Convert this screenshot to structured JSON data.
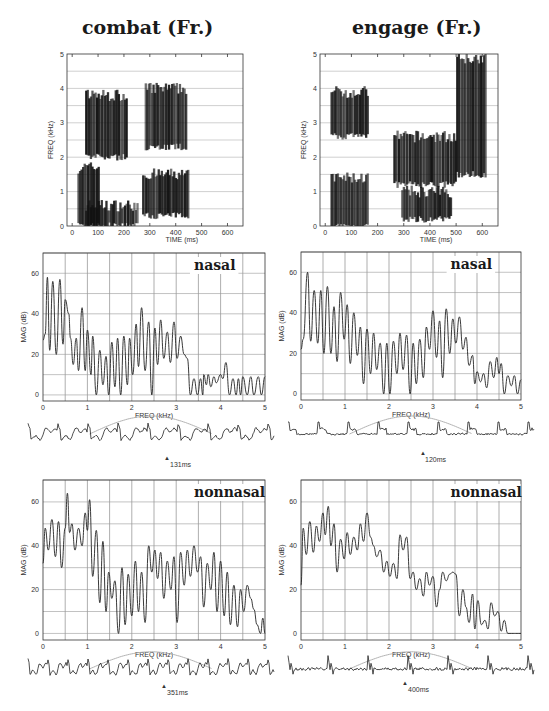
{
  "figure": {
    "columns": [
      {
        "title": "combat (Fr.)",
        "spectrogram": {
          "xlabel": "TIME (ms)",
          "ylabel": "FREQ (kHz)",
          "xticks": [
            "0",
            "100",
            "200",
            "300",
            "400",
            "500",
            "600"
          ],
          "yticks": [
            "0",
            "1",
            "2",
            "3",
            "4",
            "5"
          ]
        },
        "nasal": {
          "tag": "nasal",
          "xlabel": "FREQ (kHz)",
          "ylabel": "MAG (dB)",
          "xticks": [
            "0",
            "1",
            "2",
            "3",
            "4",
            "5"
          ],
          "yticks": [
            "0",
            "20",
            "40",
            "60"
          ],
          "time_marker": "131ms"
        },
        "nonnasal": {
          "tag": "nonnasal",
          "xlabel": "FREQ (kHz)",
          "ylabel": "MAG (dB)",
          "xticks": [
            "0",
            "1",
            "2",
            "3",
            "4",
            "5"
          ],
          "yticks": [
            "0",
            "20",
            "40",
            "60"
          ],
          "time_marker": "351ms"
        }
      },
      {
        "title": "engage (Fr.)",
        "spectrogram": {
          "xlabel": "TIME (ms)",
          "ylabel": "FREQ (kHz)",
          "xticks": [
            "0",
            "100",
            "200",
            "300",
            "400",
            "500",
            "600"
          ],
          "yticks": [
            "0",
            "1",
            "2",
            "3",
            "4",
            "5"
          ]
        },
        "nasal": {
          "tag": "nasal",
          "xlabel": "FREQ (kHz)",
          "ylabel": "MAG (dB)",
          "xticks": [
            "0",
            "1",
            "2",
            "3",
            "4",
            "5"
          ],
          "yticks": [
            "0",
            "20",
            "40",
            "60"
          ],
          "time_marker": "120ms"
        },
        "nonnasal": {
          "tag": "nonnasal",
          "xlabel": "FREQ (kHz)",
          "ylabel": "MAG (dB)",
          "xticks": [
            "0",
            "1",
            "2",
            "3",
            "4",
            "5"
          ],
          "yticks": [
            "0",
            "20",
            "40",
            "60"
          ],
          "time_marker": "400ms"
        }
      }
    ]
  },
  "chart_data": [
    {
      "type": "heatmap",
      "title": "combat (Fr.)",
      "xlabel": "TIME (ms)",
      "ylabel": "FREQ (kHz)",
      "xlim": [
        -20,
        660
      ],
      "ylim": [
        0,
        5
      ],
      "grid": true,
      "regions_dark": [
        {
          "time_ms": [
            20,
            100
          ],
          "freq_khz": [
            0,
            1.7
          ]
        },
        {
          "time_ms": [
            50,
            250
          ],
          "freq_khz": [
            0,
            0.6
          ]
        },
        {
          "time_ms": [
            50,
            210
          ],
          "freq_khz": [
            2.0,
            3.8
          ]
        },
        {
          "time_ms": [
            270,
            450
          ],
          "freq_khz": [
            0.3,
            1.5
          ]
        },
        {
          "time_ms": [
            280,
            440
          ],
          "freq_khz": [
            2.3,
            4.0
          ]
        }
      ]
    },
    {
      "type": "heatmap",
      "title": "engage (Fr.)",
      "xlabel": "TIME (ms)",
      "ylabel": "FREQ (kHz)",
      "xlim": [
        -20,
        660
      ],
      "ylim": [
        0,
        5
      ],
      "grid": true,
      "regions_dark": [
        {
          "time_ms": [
            20,
            160
          ],
          "freq_khz": [
            2.6,
            3.9
          ]
        },
        {
          "time_ms": [
            20,
            160
          ],
          "freq_khz": [
            0,
            1.4
          ]
        },
        {
          "time_ms": [
            260,
            500
          ],
          "freq_khz": [
            1.2,
            2.6
          ]
        },
        {
          "time_ms": [
            290,
            480
          ],
          "freq_khz": [
            0.2,
            1.0
          ]
        },
        {
          "time_ms": [
            500,
            610
          ],
          "freq_khz": [
            1.5,
            4.9
          ]
        }
      ]
    },
    {
      "type": "line",
      "title": "combat nasal (131ms)",
      "xlabel": "FREQ (kHz)",
      "ylabel": "MAG (dB)",
      "xlim": [
        0,
        5
      ],
      "ylim": [
        -3,
        70
      ],
      "grid": true,
      "x": [
        0,
        0.05,
        0.1,
        0.15,
        0.22,
        0.3,
        0.38,
        0.45,
        0.5,
        0.58,
        0.62,
        0.68,
        0.75,
        0.8,
        0.88,
        0.95,
        1.0,
        1.08,
        1.12,
        1.2,
        1.28,
        1.35,
        1.42,
        1.48,
        1.55,
        1.62,
        1.68,
        1.75,
        1.82,
        1.9,
        1.95,
        2.02,
        2.1,
        2.15,
        2.22,
        2.3,
        2.38,
        2.45,
        2.52,
        2.58,
        2.65,
        2.72,
        2.8,
        2.87,
        2.95,
        3.02,
        3.1,
        3.18,
        3.25,
        3.32,
        3.4,
        3.48,
        3.55,
        3.6,
        3.62,
        3.68,
        3.72,
        3.78,
        3.85,
        3.9,
        4.0,
        4.05,
        4.12,
        4.2,
        4.28,
        4.35,
        4.4,
        4.45,
        4.5,
        4.6,
        4.68,
        4.75,
        4.85,
        4.92,
        5.0
      ],
      "y": [
        27,
        30,
        58,
        22,
        56,
        20,
        57,
        25,
        47,
        40,
        28,
        15,
        28,
        12,
        43,
        12,
        32,
        10,
        29,
        0,
        22,
        5,
        19,
        0,
        26,
        4,
        28,
        0,
        29,
        5,
        28,
        10,
        35,
        14,
        43,
        12,
        36,
        0,
        33,
        15,
        37,
        18,
        31,
        16,
        36,
        18,
        29,
        20,
        18,
        0,
        8,
        0,
        8,
        0,
        10,
        5,
        10,
        4,
        9,
        6,
        10,
        8,
        16,
        0,
        8,
        0,
        8,
        0,
        9,
        0,
        9,
        0,
        9,
        0,
        9
      ],
      "annotations": [
        "nasal"
      ]
    },
    {
      "type": "line",
      "title": "engage nasal (120ms)",
      "xlabel": "FREQ (kHz)",
      "ylabel": "MAG (dB)",
      "xlim": [
        0,
        5
      ],
      "ylim": [
        -3,
        70
      ],
      "grid": true,
      "x": [
        0,
        0.05,
        0.15,
        0.22,
        0.3,
        0.38,
        0.45,
        0.52,
        0.6,
        0.68,
        0.75,
        0.82,
        0.9,
        0.98,
        1.05,
        1.12,
        1.2,
        1.28,
        1.35,
        1.42,
        1.5,
        1.58,
        1.65,
        1.72,
        1.8,
        1.88,
        1.95,
        2.02,
        2.1,
        2.18,
        2.25,
        2.32,
        2.4,
        2.48,
        2.55,
        2.62,
        2.7,
        2.78,
        2.85,
        2.92,
        3.0,
        3.08,
        3.15,
        3.22,
        3.3,
        3.38,
        3.45,
        3.52,
        3.6,
        3.68,
        3.75,
        3.82,
        3.9,
        3.95,
        4.0,
        4.08,
        4.15,
        4.22,
        4.3,
        4.38,
        4.45,
        4.5,
        4.55,
        4.62,
        4.7,
        4.78,
        4.85,
        4.92,
        5.0
      ],
      "y": [
        22,
        27,
        60,
        26,
        51,
        25,
        51,
        20,
        53,
        20,
        43,
        16,
        50,
        27,
        44,
        15,
        40,
        19,
        33,
        5,
        32,
        10,
        30,
        12,
        25,
        0,
        25,
        0,
        26,
        10,
        30,
        12,
        29,
        0,
        25,
        5,
        27,
        8,
        33,
        22,
        41,
        18,
        36,
        8,
        42,
        20,
        37,
        25,
        38,
        22,
        28,
        14,
        19,
        5,
        11,
        6,
        10,
        3,
        16,
        8,
        18,
        10,
        15,
        0,
        9,
        4,
        9,
        0,
        7
      ],
      "annotations": [
        "nasal"
      ]
    },
    {
      "type": "line",
      "title": "combat nonnasal (351ms)",
      "xlabel": "FREQ (kHz)",
      "ylabel": "MAG (dB)",
      "xlim": [
        0,
        5
      ],
      "ylim": [
        -3,
        70
      ],
      "grid": true,
      "x": [
        0,
        0.05,
        0.12,
        0.2,
        0.28,
        0.35,
        0.42,
        0.5,
        0.55,
        0.6,
        0.65,
        0.72,
        0.8,
        0.88,
        0.95,
        1.0,
        1.05,
        1.12,
        1.2,
        1.28,
        1.35,
        1.42,
        1.48,
        1.55,
        1.62,
        1.7,
        1.78,
        1.85,
        1.92,
        2.0,
        2.08,
        2.15,
        2.22,
        2.3,
        2.38,
        2.45,
        2.52,
        2.58,
        2.65,
        2.72,
        2.8,
        2.88,
        2.95,
        3.02,
        3.1,
        3.18,
        3.25,
        3.32,
        3.4,
        3.48,
        3.55,
        3.62,
        3.7,
        3.78,
        3.85,
        3.92,
        4.0,
        4.08,
        4.15,
        4.22,
        4.3,
        4.38,
        4.45,
        4.52,
        4.6,
        4.68,
        4.75,
        4.82,
        4.9,
        4.95,
        5.0
      ],
      "y": [
        32,
        48,
        38,
        52,
        35,
        51,
        30,
        48,
        64,
        46,
        50,
        38,
        48,
        40,
        55,
        47,
        61,
        26,
        47,
        14,
        42,
        10,
        28,
        16,
        24,
        0,
        30,
        4,
        27,
        8,
        33,
        10,
        28,
        5,
        40,
        28,
        38,
        25,
        37,
        16,
        33,
        20,
        35,
        5,
        37,
        22,
        38,
        26,
        40,
        28,
        35,
        12,
        32,
        20,
        37,
        10,
        33,
        8,
        28,
        4,
        22,
        3,
        20,
        10,
        22,
        16,
        11,
        4,
        0,
        7,
        0
      ],
      "annotations": [
        "nonnasal"
      ]
    },
    {
      "type": "line",
      "title": "engage nonnasal (400ms)",
      "xlabel": "FREQ (kHz)",
      "ylabel": "MAG (dB)",
      "xlim": [
        0,
        5
      ],
      "ylim": [
        -3,
        70
      ],
      "grid": true,
      "x": [
        0,
        0.05,
        0.12,
        0.2,
        0.28,
        0.35,
        0.42,
        0.5,
        0.55,
        0.62,
        0.68,
        0.75,
        0.82,
        0.9,
        0.98,
        1.05,
        1.12,
        1.2,
        1.28,
        1.35,
        1.42,
        1.5,
        1.58,
        1.65,
        1.72,
        1.8,
        1.88,
        1.95,
        2.02,
        2.1,
        2.18,
        2.25,
        2.32,
        2.4,
        2.48,
        2.55,
        2.62,
        2.7,
        2.78,
        2.85,
        2.92,
        3.0,
        3.08,
        3.15,
        3.22,
        3.3,
        3.38,
        3.45,
        3.52,
        3.6,
        3.68,
        3.75,
        3.82,
        3.9,
        3.95,
        4.02,
        4.1,
        4.18,
        4.25,
        4.32,
        4.4,
        4.48,
        4.55,
        4.62,
        4.7,
        5.0
      ],
      "y": [
        22,
        48,
        36,
        51,
        37,
        49,
        42,
        55,
        45,
        58,
        40,
        50,
        28,
        43,
        34,
        46,
        36,
        44,
        38,
        50,
        42,
        55,
        44,
        40,
        35,
        38,
        28,
        33,
        26,
        32,
        25,
        45,
        38,
        44,
        25,
        28,
        20,
        25,
        17,
        28,
        22,
        26,
        12,
        20,
        28,
        24,
        27,
        28,
        27,
        8,
        20,
        12,
        5,
        18,
        2,
        15,
        4,
        6,
        2,
        14,
        8,
        10,
        1,
        6,
        0,
        0
      ],
      "annotations": [
        "nonnasal"
      ]
    }
  ]
}
